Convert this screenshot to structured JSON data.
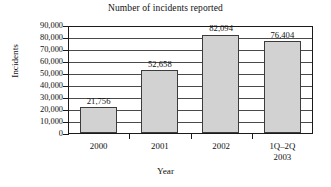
{
  "chart_data": {
    "type": "bar",
    "title": "Number of incidents reported",
    "xlabel": "Year",
    "ylabel": "Incidents",
    "categories": [
      "2000",
      "2001",
      "2002",
      "1Q–2Q 2003"
    ],
    "category_lines": [
      [
        "2000"
      ],
      [
        "2001"
      ],
      [
        "2002"
      ],
      [
        "1Q–2Q",
        "2003"
      ]
    ],
    "values": [
      21756,
      52658,
      82094,
      76404
    ],
    "value_labels": [
      "21,756",
      "52,658",
      "82,094",
      "76,404"
    ],
    "ylim": [
      0,
      90000
    ],
    "ytick_values": [
      90000,
      80000,
      70000,
      60000,
      50000,
      40000,
      30000,
      20000,
      10000,
      0
    ],
    "ytick_labels": [
      "90,000",
      "80,000",
      "70,000",
      "60,000",
      "50,000",
      "40,000",
      "30,000",
      "20,000",
      "10,000",
      "0"
    ],
    "grid": true,
    "legend": null,
    "bar_color": "#d2d2d2",
    "bar_border_color": "#3c3c3c",
    "axis_color": "#1a1a1a",
    "background": "#ffffff"
  }
}
